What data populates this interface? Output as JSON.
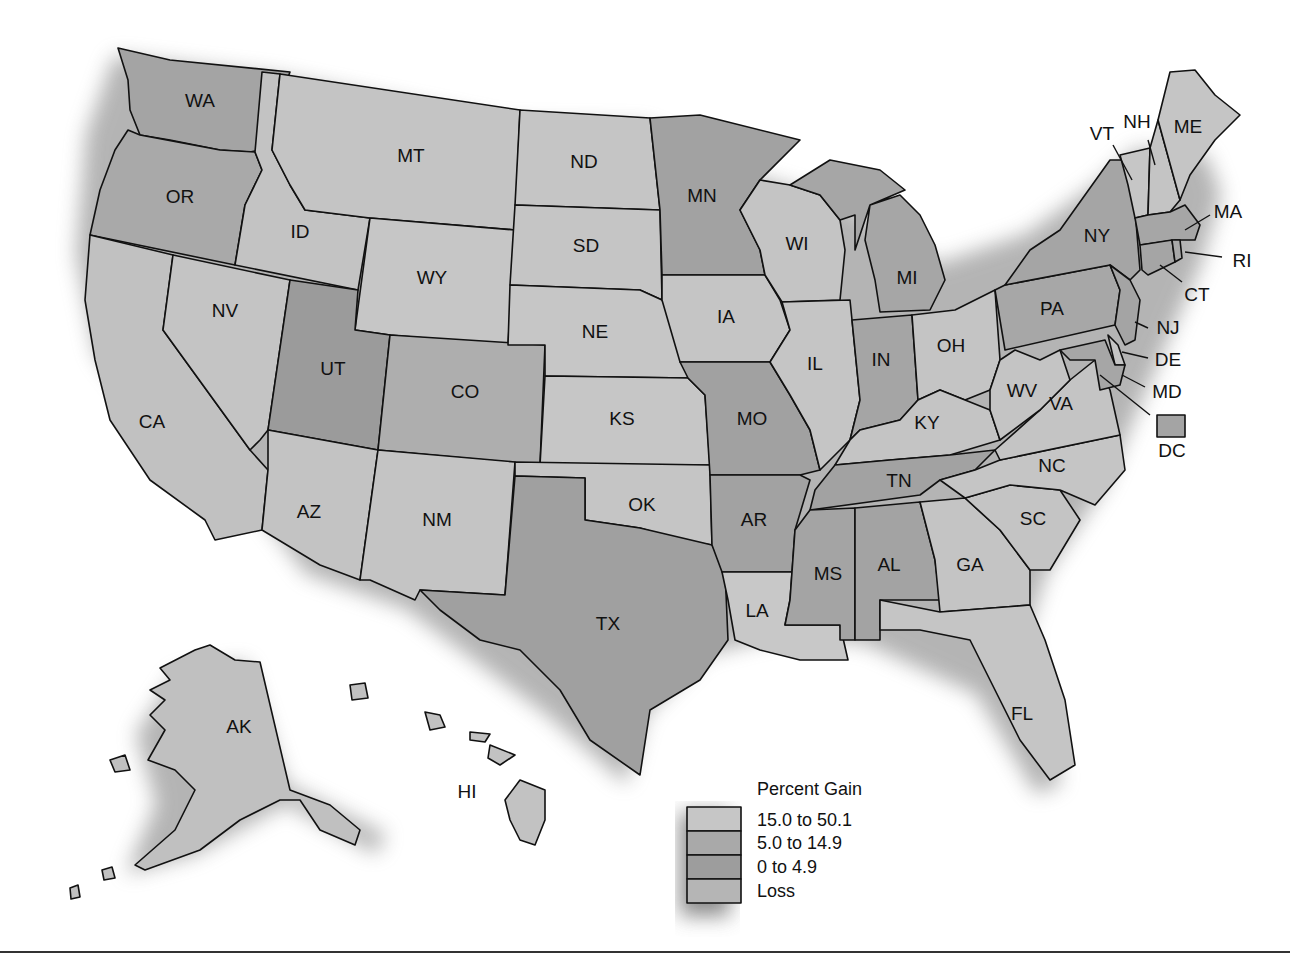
{
  "map": {
    "title_hidden": "",
    "colors": {
      "gain_15_to_50": "#c6c6c6",
      "gain_5_to_15": "#a9a9a9",
      "gain_0_to_5": "#9a9a9a",
      "loss": "#bdbdbd",
      "shadow": "#8a8a8a",
      "outline": "#111111"
    },
    "states": {
      "WA": "WA",
      "OR": "OR",
      "CA": "CA",
      "ID": "ID",
      "NV": "NV",
      "MT": "MT",
      "WY": "WY",
      "UT": "UT",
      "AZ": "AZ",
      "CO": "CO",
      "NM": "NM",
      "ND": "ND",
      "SD": "SD",
      "NE": "NE",
      "KS": "KS",
      "OK": "OK",
      "TX": "TX",
      "MN": "MN",
      "IA": "IA",
      "MO": "MO",
      "AR": "AR",
      "LA": "LA",
      "WI": "WI",
      "IL": "IL",
      "MI": "MI",
      "IN": "IN",
      "OH": "OH",
      "KY": "KY",
      "TN": "TN",
      "MS": "MS",
      "AL": "AL",
      "GA": "GA",
      "FL": "FL",
      "SC": "SC",
      "NC": "NC",
      "VA": "VA",
      "WV": "WV",
      "PA": "PA",
      "NY": "NY",
      "VT": "VT",
      "NH": "NH",
      "ME": "ME",
      "MA": "MA",
      "RI": "RI",
      "CT": "CT",
      "NJ": "NJ",
      "DE": "DE",
      "MD": "MD",
      "DC": "DC",
      "AK": "AK",
      "HI": "HI"
    }
  },
  "legend": {
    "title": "Percent Gain",
    "items": [
      {
        "label": "15.0 to 50.1"
      },
      {
        "label": "5.0 to 14.9"
      },
      {
        "label": "0 to 4.9"
      },
      {
        "label": "Loss"
      }
    ]
  }
}
